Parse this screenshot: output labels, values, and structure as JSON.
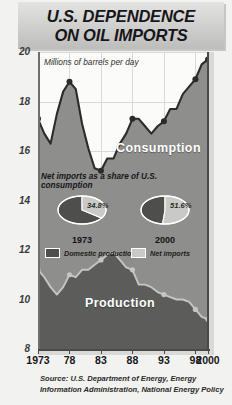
{
  "title": {
    "line1": "U.S. DEPENDENCE",
    "line2": "ON OIL IMPORTS"
  },
  "units_note": "Millions of barrels per day",
  "series_labels": {
    "consumption": "Consumption",
    "production": "Production"
  },
  "inset": {
    "heading": "Net imports as a share of U.S. consumption",
    "pies": [
      {
        "year": "1973",
        "percent_label": "34.8%",
        "net_imports": 34.8,
        "domestic_production": 65.2
      },
      {
        "year": "2000",
        "percent_label": "51.6%",
        "net_imports": 51.6,
        "domestic_production": 48.4
      }
    ],
    "legend": [
      {
        "label": "Domestic production",
        "color": "#4e4e4c"
      },
      {
        "label": "Net imports",
        "color": "#c9c9c6"
      }
    ]
  },
  "source": "Source: U.S. Department of Energy, Energy Information Administration, National Energy Policy",
  "chart_data": {
    "type": "area",
    "title": "U.S. DEPENDENCE ON OIL IMPORTS",
    "xlabel": "",
    "ylabel": "Millions of barrels per day",
    "ylim": [
      8,
      20
    ],
    "xlim": [
      1973,
      2000
    ],
    "grid": true,
    "legend_position": "inline-labels",
    "ytick_labels": [
      "20",
      "18",
      "16",
      "14",
      "12",
      "10",
      "8"
    ],
    "yticks": [
      20,
      18,
      16,
      14,
      12,
      10,
      8
    ],
    "xtick_labels": [
      "1973",
      "78",
      "83",
      "88",
      "93",
      "98",
      "2000"
    ],
    "xticks": [
      1973,
      1978,
      1983,
      1988,
      1993,
      1998,
      2000
    ],
    "x": [
      1973,
      1974,
      1975,
      1976,
      1977,
      1978,
      1979,
      1980,
      1981,
      1982,
      1983,
      1984,
      1985,
      1986,
      1987,
      1988,
      1989,
      1990,
      1991,
      1992,
      1993,
      1994,
      1995,
      1996,
      1997,
      1998,
      1999,
      2000
    ],
    "series": [
      {
        "name": "Consumption",
        "color": "#8e8e8c",
        "line_color": "#2b2b29",
        "values": [
          17.3,
          16.7,
          16.3,
          17.5,
          18.4,
          18.8,
          18.5,
          17.1,
          16.1,
          15.3,
          15.2,
          15.7,
          15.7,
          16.3,
          16.7,
          17.3,
          17.3,
          17.0,
          16.7,
          17.0,
          17.2,
          17.7,
          17.7,
          18.3,
          18.6,
          18.9,
          19.5,
          19.7
        ]
      },
      {
        "name": "Production",
        "color": "#5c5c5a",
        "line_color": "#c5c5c2",
        "values": [
          11.2,
          10.9,
          10.5,
          10.2,
          10.5,
          11.0,
          10.9,
          11.2,
          11.2,
          11.4,
          11.6,
          11.8,
          11.9,
          11.6,
          11.3,
          11.2,
          10.6,
          10.6,
          10.5,
          10.3,
          10.2,
          10.1,
          10.0,
          10.0,
          9.9,
          9.6,
          9.3,
          9.2
        ]
      }
    ]
  }
}
